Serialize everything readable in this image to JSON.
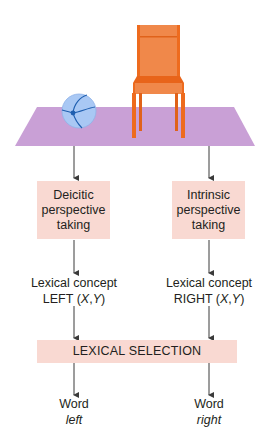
{
  "diagram": {
    "colors": {
      "rug": "#c9a0d6",
      "ball_fill": "#a9c8f4",
      "ball_lines": "#1f5fb0",
      "chair": "#ee6b1e",
      "chair_light": "#f0884a",
      "box_fill": "#f9d9d2",
      "arrow": "#3a3a3a"
    },
    "scene": {
      "objects": [
        "ball-icon",
        "chair-icon",
        "rug"
      ]
    },
    "left_branch": {
      "process_lines": [
        "Deicitic",
        "perspective",
        "taking"
      ],
      "concept_line1": "Lexical concept",
      "concept_main": "LEFT (",
      "concept_x": "X",
      "concept_sep": ",",
      "concept_y": "Y",
      "concept_close": ")",
      "word_label": "Word",
      "word_value": "left"
    },
    "right_branch": {
      "process_lines": [
        "Intrinsic",
        "perspective",
        "taking"
      ],
      "concept_line1": "Lexical concept",
      "concept_main": "RIGHT (",
      "concept_x": "X",
      "concept_sep": ",",
      "concept_y": "Y",
      "concept_close": ")",
      "word_label": "Word",
      "word_value": "right"
    },
    "selection_label": "LEXICAL SELECTION"
  }
}
